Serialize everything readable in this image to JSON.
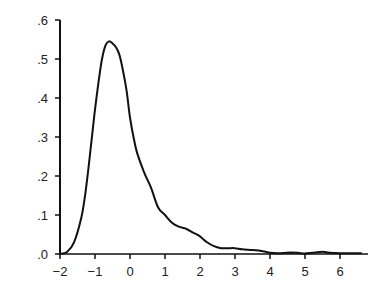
{
  "chart_data": {
    "type": "line",
    "title": "",
    "xlabel": "",
    "ylabel": "",
    "xlim": [
      -2,
      6.8
    ],
    "ylim": [
      0,
      0.6
    ],
    "grid": false,
    "legend": null,
    "x_ticks": [
      -2,
      -1,
      0,
      1,
      2,
      3,
      4,
      5,
      6
    ],
    "x_tick_labels": [
      "−2",
      "−1",
      "0",
      "1",
      "2",
      "3",
      "4",
      "5",
      "6"
    ],
    "y_ticks": [
      0,
      0.1,
      0.2,
      0.3,
      0.4,
      0.5,
      0.6
    ],
    "y_tick_labels": [
      ".0",
      ".1",
      ".2",
      ".3",
      ".4",
      ".5",
      ".6"
    ],
    "series": [
      {
        "name": "density",
        "color": "#111111",
        "x": [
          -2.0,
          -1.8,
          -1.6,
          -1.4,
          -1.3,
          -1.2,
          -1.1,
          -1.0,
          -0.9,
          -0.8,
          -0.7,
          -0.6,
          -0.5,
          -0.4,
          -0.3,
          -0.2,
          -0.1,
          0.0,
          0.1,
          0.2,
          0.4,
          0.6,
          0.8,
          1.0,
          1.2,
          1.4,
          1.6,
          1.8,
          2.0,
          2.2,
          2.4,
          2.6,
          2.8,
          3.0,
          3.2,
          3.5,
          3.8,
          4.0,
          4.3,
          4.6,
          4.8,
          5.0,
          5.2,
          5.5,
          5.7,
          6.0,
          6.3,
          6.6
        ],
        "y": [
          0.0,
          0.005,
          0.03,
          0.09,
          0.14,
          0.21,
          0.29,
          0.37,
          0.44,
          0.5,
          0.535,
          0.545,
          0.54,
          0.53,
          0.51,
          0.47,
          0.42,
          0.35,
          0.3,
          0.26,
          0.21,
          0.17,
          0.12,
          0.1,
          0.08,
          0.07,
          0.065,
          0.055,
          0.045,
          0.03,
          0.02,
          0.015,
          0.015,
          0.015,
          0.012,
          0.01,
          0.007,
          0.003,
          0.002,
          0.004,
          0.003,
          0.001,
          0.003,
          0.006,
          0.003,
          0.002,
          0.002,
          0.002
        ]
      }
    ]
  }
}
